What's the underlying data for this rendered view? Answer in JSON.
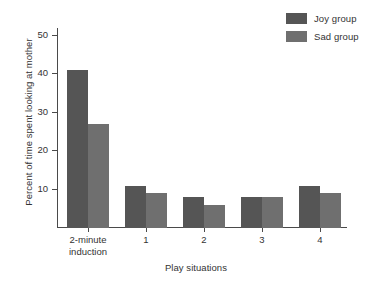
{
  "chart_data": {
    "type": "bar",
    "title": "",
    "xlabel": "Play situations",
    "ylabel": "Percent of time spent looking at mother",
    "categories": [
      "2-minute\ninduction",
      "1",
      "2",
      "3",
      "4"
    ],
    "series": [
      {
        "name": "Joy group",
        "color": "#555555",
        "values": [
          41,
          11,
          8,
          8,
          11
        ]
      },
      {
        "name": "Sad group",
        "color": "#6f6f6f",
        "values": [
          27,
          9,
          6,
          8,
          9
        ]
      }
    ],
    "ylim": [
      0,
      52
    ],
    "yticks": [
      10,
      20,
      30,
      40,
      50
    ],
    "ytick_labels": [
      "10",
      "20",
      "30",
      "40",
      "50"
    ],
    "grid": false,
    "legend_position": "top-right"
  },
  "legend": {
    "entries": [
      {
        "label": "Joy group",
        "color": "#555555"
      },
      {
        "label": "Sad group",
        "color": "#6f6f6f"
      }
    ]
  },
  "axes": {
    "y_title": "Percent of time spent looking at mother",
    "x_title": "Play situations"
  }
}
